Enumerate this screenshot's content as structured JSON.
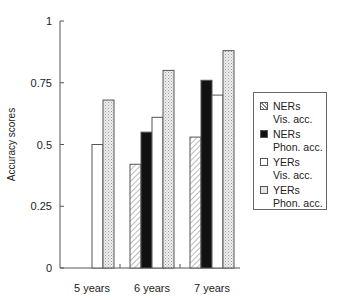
{
  "chart_data": {
    "type": "bar",
    "title": "",
    "xlabel": "",
    "ylabel": "Accuracy scores",
    "ylim": [
      0,
      1
    ],
    "yticks": [
      "0",
      "0.25",
      "0.5",
      "0.75",
      "1"
    ],
    "grid": false,
    "legend_position": "right",
    "categories": [
      "5 years",
      "6 years",
      "7 years"
    ],
    "series": [
      {
        "name": "NERs Vis. acc.",
        "line1": "NERs",
        "line2": "Vis. acc.",
        "pattern": "hatch",
        "values": [
          null,
          0.42,
          0.53
        ]
      },
      {
        "name": "NERs Phon. acc.",
        "line1": "NERs",
        "line2": "Phon. acc.",
        "pattern": "solid-black",
        "values": [
          null,
          0.55,
          0.76
        ]
      },
      {
        "name": "YERs Vis. acc.",
        "line1": "YERs",
        "line2": "Vis. acc.",
        "pattern": "white",
        "values": [
          0.5,
          0.61,
          0.7
        ]
      },
      {
        "name": "YERs Phon. acc.",
        "line1": "YERs",
        "line2": "Phon. acc.",
        "pattern": "dotted",
        "values": [
          0.68,
          0.8,
          0.88
        ]
      }
    ]
  }
}
